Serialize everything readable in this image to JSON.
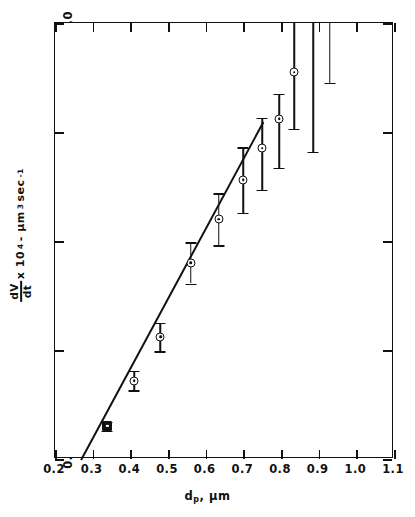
{
  "figure": {
    "background": "#ffffff",
    "ink_color": "#111111"
  },
  "axes": {
    "x": {
      "title_main": "d",
      "title_sub": "p",
      "title_tail": ", μm",
      "ticks": [
        "0.2",
        "0.3",
        "0.4",
        "0.5",
        "0.6",
        "0.7",
        "0.8",
        "0.9",
        "1.0",
        "1.1"
      ],
      "min": 0.2,
      "max": 1.1
    },
    "y": {
      "title_numerator": "dV",
      "title_denominator": "dt",
      "title_rest": "x 10",
      "title_exp": "4",
      "title_units": "- μm",
      "title_units_exp": "3",
      "title_units_tail": "sec",
      "title_units_tail_exp": "-1",
      "ticks": [
        "0.0",
        "1.0",
        "2.0",
        "3.0",
        "4.0"
      ],
      "min": 0.0,
      "max": 4.0
    }
  },
  "chart_data": {
    "type": "scatter",
    "title": "",
    "xlabel": "d_p, μm",
    "ylabel": "dV/dt x 10^4 - μm^3 sec^-1",
    "xlim": [
      0.2,
      1.1
    ],
    "ylim": [
      0.0,
      4.0
    ],
    "grid": false,
    "legend": "none",
    "x": [
      0.339,
      0.41,
      0.48,
      0.56,
      0.635,
      0.7,
      0.75,
      0.795,
      0.835,
      0.885,
      0.93
    ],
    "y": [
      0.3,
      0.72,
      1.12,
      1.8,
      2.2,
      2.56,
      2.85,
      3.12,
      3.55,
      4.0,
      4.0
    ],
    "yerr_low": [
      0.04,
      0.09,
      0.13,
      0.19,
      0.24,
      0.3,
      0.38,
      0.45,
      0.52,
      1.18,
      0.55
    ],
    "yerr_high": [
      0.04,
      0.09,
      0.13,
      0.19,
      0.24,
      0.3,
      0.28,
      0.23,
      0.45,
      0.0,
      0.0
    ],
    "marker_shapes": [
      "square",
      "circle",
      "circle",
      "circle",
      "circle",
      "circle",
      "circle",
      "circle",
      "circle",
      "none",
      "none"
    ],
    "fit_line": {
      "label": "linear fit",
      "x_start": 0.268,
      "y_start": 0.0,
      "x_end": 0.752,
      "y_end": 3.1
    }
  }
}
